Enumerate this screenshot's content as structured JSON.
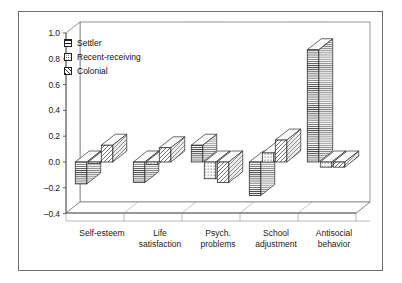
{
  "chart_data": {
    "type": "bar",
    "title": "",
    "subtitle": "",
    "xlabel": "",
    "ylabel": "",
    "ylim": [
      -0.4,
      1.0
    ],
    "ytick_step": 0.2,
    "yticks": [
      "1.0",
      "0.8",
      "0.6",
      "0.4",
      "0.2",
      "0.0",
      "-0.2",
      "-0.4"
    ],
    "ytick_values": [
      1.0,
      0.8,
      0.6,
      0.4,
      0.2,
      0.0,
      -0.2,
      -0.4
    ],
    "grid": true,
    "grid_style": "dotted-horizontal",
    "three_d": true,
    "legend_position": "top-left-inside",
    "categories": [
      "Self-esteem",
      "Life satisfaction",
      "Psych. problems",
      "School adjustment",
      "Antisocial behavior"
    ],
    "category_lines": [
      [
        "Self-esteem"
      ],
      [
        "Life",
        "satisfaction"
      ],
      [
        "Psych.",
        "problems"
      ],
      [
        "School",
        "adjustment"
      ],
      [
        "Antisocial",
        "behavior"
      ]
    ],
    "series": [
      {
        "name": "Settler",
        "pattern": "horizontal-lines",
        "values": [
          -0.17,
          -0.16,
          0.13,
          -0.26,
          0.87
        ]
      },
      {
        "name": "Recent-receiving",
        "pattern": "cross-dots",
        "values": [
          -0.01,
          -0.02,
          -0.13,
          0.07,
          -0.04
        ]
      },
      {
        "name": "Colonial",
        "pattern": "diagonal-hatch",
        "values": [
          0.13,
          0.11,
          -0.16,
          0.17,
          -0.04
        ]
      }
    ]
  },
  "legend": {
    "items": [
      {
        "label": "Settler"
      },
      {
        "label": "Recent-receiving"
      },
      {
        "label": "Colonial"
      }
    ]
  },
  "colors": {
    "bar_fill": "#ffffff",
    "bar_stroke": "#1a1a1a",
    "axis": "#555555",
    "grid": "#b9b9b9",
    "frame": "#6f6f6f",
    "text": "#1a1a1a"
  }
}
